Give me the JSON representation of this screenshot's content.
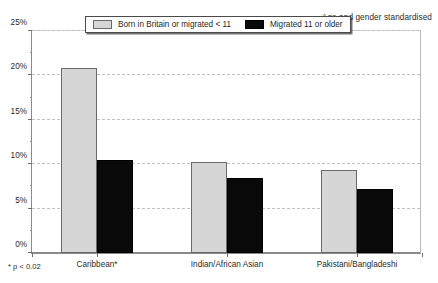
{
  "header": {
    "note": "Age and gender standardised"
  },
  "footnote": {
    "text": "* p < 0.02"
  },
  "legend": {
    "entries": [
      {
        "label": "Born in Britain or migrated < 11",
        "color": "#d6d6d6",
        "swatch": "light"
      },
      {
        "label": "Migrated 11 or older",
        "color": "#090909",
        "swatch": "dark"
      }
    ]
  },
  "axes": {
    "y_ticks": [
      "0%",
      "5%",
      "10%",
      "15%",
      "20%",
      "25%"
    ],
    "y_minor_ticks": [
      2.5,
      7.5,
      12.5,
      17.5,
      22.5
    ]
  },
  "chart_data": {
    "type": "bar",
    "title": "Age and gender standardised",
    "xlabel": "",
    "ylabel": "",
    "ylim": [
      0,
      25
    ],
    "ytick_values": [
      0,
      5,
      10,
      15,
      20,
      25
    ],
    "ytick_labels": [
      "0%",
      "5%",
      "10%",
      "15%",
      "20%",
      "25%"
    ],
    "grid": true,
    "grid_axis": "y",
    "legend_position": "top-center",
    "categories": [
      "Caribbean*",
      "Indian/African Asian",
      "Pakistani/Bangladeshi"
    ],
    "series": [
      {
        "name": "Born in Britain or migrated < 11",
        "color": "#d6d6d6",
        "values": [
          20.8,
          10.2,
          9.4
        ]
      },
      {
        "name": "Migrated 11 or older",
        "color": "#090909",
        "values": [
          10.5,
          8.5,
          7.2
        ]
      }
    ],
    "annotations": [
      "* p < 0.02"
    ],
    "units": "percent"
  }
}
